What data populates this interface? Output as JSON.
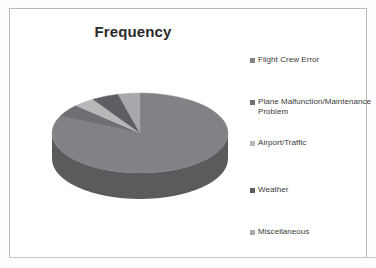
{
  "chart": {
    "title": "Frequency"
  },
  "legend": {
    "items": [
      {
        "label": "Flight Crew Error",
        "color": "#808285"
      },
      {
        "label": "Plane Malfunction/Maintenance Problem",
        "color": "#6e7073"
      },
      {
        "label": "Airport/Traffic",
        "color": "#b6b8ba"
      },
      {
        "label": "Weather",
        "color": "#5c5e61"
      },
      {
        "label": "Miscellaneous",
        "color": "#a7a9ac"
      }
    ]
  },
  "chart_data": {
    "type": "pie",
    "title": "Frequency",
    "xlabel": "",
    "ylabel": "",
    "legend_position": "right",
    "three_d": true,
    "categories": [
      "Flight Crew Error",
      "Plane Malfunction/Maintenance Problem",
      "Airport/Traffic",
      "Weather",
      "Miscellaneous"
    ],
    "values": [
      82,
      5,
      4,
      5,
      4
    ],
    "colors": [
      "#808285",
      "#6e7073",
      "#b6b8ba",
      "#5c5e61",
      "#a7a9ac"
    ],
    "start_angle_deg": 0,
    "direction": "clockwise"
  }
}
